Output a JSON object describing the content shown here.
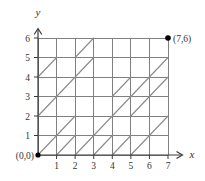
{
  "figure": {
    "title": "",
    "origin_label": "(0,0)",
    "x_axis_label": "x",
    "y_axis_label": "y",
    "x_ticks": [
      "1",
      "2",
      "3",
      "4",
      "5",
      "6",
      "7"
    ],
    "y_ticks": [
      "1",
      "2",
      "3",
      "4",
      "5",
      "6"
    ],
    "endpoint_label": "(7,6)",
    "colors": {
      "grid": "#808080",
      "diagonal": "#8a8a8a",
      "axis": "#3a3a3a",
      "text": "#333333",
      "point": "#000000",
      "background": "#ffffff"
    }
  },
  "chart_data": {
    "type": "diagram",
    "xlim": [
      0,
      7
    ],
    "ylim": [
      0,
      6
    ],
    "grid": true,
    "grid_spacing": 1,
    "points": [
      {
        "x": 7,
        "y": 6,
        "label": "(7,6)",
        "marker": "filled-circle"
      },
      {
        "x": 0,
        "y": 0,
        "label": "(0,0)",
        "marker": "filled-circle"
      }
    ],
    "diagonals": [
      {
        "x1": 0,
        "y1": 4,
        "x2": 1,
        "y2": 5
      },
      {
        "x1": 2,
        "y1": 5,
        "x2": 3,
        "y2": 6
      },
      {
        "x1": 0,
        "y1": 2,
        "x2": 3,
        "y2": 5
      },
      {
        "x1": 0,
        "y1": 0,
        "x2": 2,
        "y2": 2
      },
      {
        "x1": 2,
        "y1": 0,
        "x2": 3,
        "y2": 1
      },
      {
        "x1": 1,
        "y1": 0,
        "x2": 2,
        "y2": 1
      },
      {
        "x1": 3,
        "y1": 1,
        "x2": 6,
        "y2": 4
      },
      {
        "x1": 4,
        "y1": 3,
        "x2": 5,
        "y2": 4
      },
      {
        "x1": 5,
        "y1": 2,
        "x2": 7,
        "y2": 4
      },
      {
        "x1": 4,
        "y1": 0,
        "x2": 5,
        "y2": 1
      },
      {
        "x1": 5,
        "y1": 0,
        "x2": 7,
        "y2": 2
      },
      {
        "x1": 6,
        "y1": 4,
        "x2": 7,
        "y2": 5
      },
      {
        "x1": 3,
        "y1": 0,
        "x2": 4,
        "y2": 1
      }
    ]
  }
}
